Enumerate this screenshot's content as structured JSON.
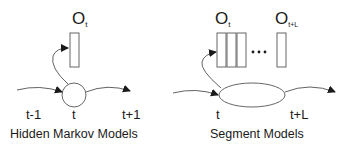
{
  "colors": {
    "stroke": "#3a3a3a",
    "box_stroke": "#555555",
    "text": "#1a1a1a",
    "background": "#ffffff"
  },
  "hmm": {
    "caption": "Hidden Markov Models",
    "observation": {
      "symbol": "O",
      "subscript": "t"
    },
    "time_labels": {
      "prev": "t-1",
      "current": "t",
      "next": "t+1"
    },
    "state_shape": "circle",
    "observation_boxes": 1
  },
  "segment": {
    "caption": "Segment Models",
    "observation_start": {
      "symbol": "O",
      "subscript": "t"
    },
    "observation_end": {
      "symbol": "O",
      "subscript": "t+L"
    },
    "ellipsis": "•••",
    "time_labels": {
      "start": "t",
      "end": "t+L"
    },
    "state_shape": "ellipse",
    "observation_boxes": 4
  }
}
